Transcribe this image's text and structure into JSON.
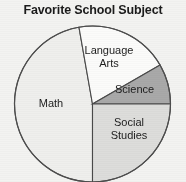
{
  "chart_data": {
    "type": "pie",
    "title": "Favorite School Subject",
    "categories": [
      "Language Arts",
      "Science",
      "Social Studies",
      "Math"
    ],
    "values": [
      19.4,
      8.3,
      25,
      47.3
    ],
    "labels": {
      "language_arts_line1": "Language",
      "language_arts_line2": "Arts",
      "science": "Science",
      "social_line1": "Social",
      "social_line2": "Studies",
      "math": "Math"
    },
    "slices": [
      {
        "name": "Science",
        "start_angle": 0,
        "end_angle": 30,
        "percent": 8.3,
        "color": "#a9a9a9"
      },
      {
        "name": "Language Arts",
        "start_angle": 30,
        "end_angle": 100,
        "percent": 19.4,
        "color": "#fbfbfa"
      },
      {
        "name": "Math",
        "start_angle": 100,
        "end_angle": 270,
        "percent": 47.3,
        "color": "#efefed"
      },
      {
        "name": "Social Studies",
        "start_angle": 270,
        "end_angle": 360,
        "percent": 25.0,
        "color": "#dddddb"
      }
    ],
    "geometry": {
      "cx": 92.5,
      "cy": 104,
      "r": 78
    },
    "stroke_color": "#4a4a4a",
    "legend": "none",
    "grid": false
  }
}
